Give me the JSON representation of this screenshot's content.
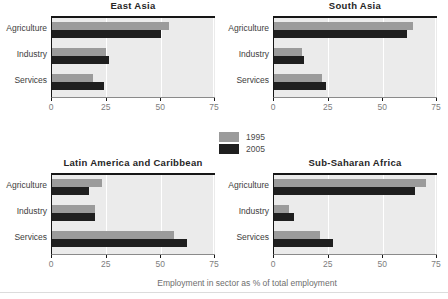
{
  "figure": {
    "axis_label": "Employment in sector as % of total employment",
    "axis_ticks": [
      "0",
      "25",
      "50",
      "75"
    ],
    "xlim": [
      0,
      75
    ],
    "grid": "on",
    "legend_position": "center-between-rows",
    "panel_bg": "#ebebeb",
    "legend": [
      {
        "label": "1995",
        "color": "#9b9b9b"
      },
      {
        "label": "2005",
        "color": "#1f1f1f"
      }
    ]
  },
  "chart_data": [
    {
      "type": "bar",
      "orientation": "horizontal",
      "title": "East Asia",
      "categories": [
        "Agriculture",
        "Industry",
        "Services"
      ],
      "series": [
        {
          "name": "1995",
          "values": [
            54,
            25,
            19
          ]
        },
        {
          "name": "2005",
          "values": [
            50,
            26,
            24
          ]
        }
      ],
      "xlim": [
        0,
        75
      ]
    },
    {
      "type": "bar",
      "orientation": "horizontal",
      "title": "South Asia",
      "categories": [
        "Agriculture",
        "Industry",
        "Services"
      ],
      "series": [
        {
          "name": "1995",
          "values": [
            64,
            13,
            22
          ]
        },
        {
          "name": "2005",
          "values": [
            61,
            14,
            24
          ]
        }
      ],
      "xlim": [
        0,
        75
      ]
    },
    {
      "type": "bar",
      "orientation": "horizontal",
      "title": "Latin America and Caribbean",
      "categories": [
        "Agriculture",
        "Industry",
        "Services"
      ],
      "series": [
        {
          "name": "1995",
          "values": [
            23,
            20,
            56
          ]
        },
        {
          "name": "2005",
          "values": [
            17,
            20,
            62
          ]
        }
      ],
      "xlim": [
        0,
        75
      ]
    },
    {
      "type": "bar",
      "orientation": "horizontal",
      "title": "Sub-Saharan Africa",
      "categories": [
        "Agriculture",
        "Industry",
        "Services"
      ],
      "series": [
        {
          "name": "1995",
          "values": [
            70,
            7,
            21
          ]
        },
        {
          "name": "2005",
          "values": [
            65,
            9,
            27
          ]
        }
      ],
      "xlim": [
        0,
        75
      ]
    }
  ]
}
